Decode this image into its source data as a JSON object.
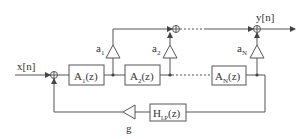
{
  "diagram": {
    "input_label": "x[n]",
    "output_label": "y[n]",
    "feedback_gain_label": "g",
    "blocks": [
      {
        "id": "A1",
        "main": "A",
        "sub": "1",
        "tail": "(z)"
      },
      {
        "id": "A2",
        "main": "A",
        "sub": "2",
        "tail": "(z)"
      },
      {
        "id": "AN",
        "main": "A",
        "sub": "N",
        "tail": "(z)"
      },
      {
        "id": "HLP",
        "main": "H",
        "sub": "LP",
        "tail": "(z)"
      }
    ],
    "gains": [
      {
        "main": "a",
        "sub": "1"
      },
      {
        "main": "a",
        "sub": "2"
      },
      {
        "main": "a",
        "sub": "N"
      }
    ],
    "colors": {
      "line": "#555555",
      "text": "#333333",
      "background": "#ffffff"
    }
  }
}
